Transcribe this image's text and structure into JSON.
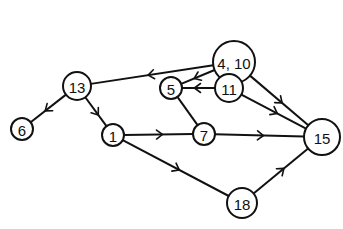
{
  "diagram": {
    "type": "directed-graph",
    "nodes": [
      {
        "id": "n4_10",
        "label": "4, 10",
        "x": 234,
        "y": 62,
        "r": 21
      },
      {
        "id": "n13",
        "label": "13",
        "x": 77,
        "y": 86,
        "r": 14
      },
      {
        "id": "n5",
        "label": "5",
        "x": 171,
        "y": 88,
        "r": 11
      },
      {
        "id": "n11",
        "label": "11",
        "x": 229,
        "y": 88,
        "r": 14
      },
      {
        "id": "n6",
        "label": "6",
        "x": 22,
        "y": 129,
        "r": 11
      },
      {
        "id": "n1",
        "label": "1",
        "x": 113,
        "y": 135,
        "r": 11
      },
      {
        "id": "n7",
        "label": "7",
        "x": 204,
        "y": 134,
        "r": 11
      },
      {
        "id": "n15",
        "label": "15",
        "x": 322,
        "y": 137,
        "r": 18
      },
      {
        "id": "n18",
        "label": "18",
        "x": 242,
        "y": 203,
        "r": 15
      }
    ],
    "edges": [
      {
        "from": "n4_10",
        "to": "n13",
        "arrow": true
      },
      {
        "from": "n4_10",
        "to": "n5",
        "arrow": true
      },
      {
        "from": "n4_10",
        "to": "n11",
        "arrow": true
      },
      {
        "from": "n4_10",
        "to": "n15",
        "arrow": true
      },
      {
        "from": "n11",
        "to": "n5",
        "arrow": true
      },
      {
        "from": "n11",
        "to": "n15",
        "arrow": true
      },
      {
        "from": "n13",
        "to": "n6",
        "arrow": true
      },
      {
        "from": "n13",
        "to": "n1",
        "arrow": true
      },
      {
        "from": "n5",
        "to": "n7",
        "arrow": false
      },
      {
        "from": "n1",
        "to": "n7",
        "arrow": true
      },
      {
        "from": "n1",
        "to": "n18",
        "arrow": true
      },
      {
        "from": "n7",
        "to": "n15",
        "arrow": true
      },
      {
        "from": "n18",
        "to": "n15",
        "arrow": true
      }
    ]
  }
}
